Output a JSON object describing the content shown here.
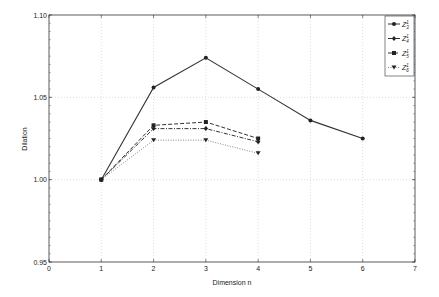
{
  "chart_data": {
    "type": "line",
    "title": "",
    "xlabel": "Dimension n",
    "ylabel": "Dilation",
    "xlim": [
      0,
      7
    ],
    "ylim": [
      0.95,
      1.1
    ],
    "xticks": [
      "0",
      "1",
      "2",
      "3",
      "4",
      "5",
      "6",
      "7"
    ],
    "yticks": [
      "0.95",
      "1.00",
      "1.05",
      "1.10"
    ],
    "grid": true,
    "legend_position": "upper right",
    "series": [
      {
        "name": "Z_3^1",
        "label_main": "Z",
        "label_sup": "1",
        "label_sub": "3",
        "marker": "circle",
        "line": "solid",
        "x": [
          1,
          2,
          3,
          4,
          5,
          6
        ],
        "values": [
          1.0,
          1.056,
          1.074,
          1.055,
          1.036,
          1.025
        ]
      },
      {
        "name": "Z_4^1",
        "label_main": "Z",
        "label_sup": "1",
        "label_sub": "4",
        "marker": "diamond",
        "line": "dashdot",
        "x": [
          1,
          2,
          3,
          4
        ],
        "values": [
          1.0,
          1.031,
          1.031,
          1.023
        ]
      },
      {
        "name": "Z_5^1",
        "label_main": "Z",
        "label_sup": "1",
        "label_sub": "5",
        "marker": "square",
        "line": "dashed",
        "x": [
          1,
          2,
          3,
          4
        ],
        "values": [
          1.0,
          1.033,
          1.035,
          1.025
        ]
      },
      {
        "name": "Z_6^1",
        "label_main": "Z",
        "label_sup": "1",
        "label_sub": "6",
        "marker": "triangle-down",
        "line": "dotted",
        "x": [
          1,
          2,
          3,
          4
        ],
        "values": [
          1.0,
          1.024,
          1.024,
          1.016
        ]
      }
    ]
  }
}
